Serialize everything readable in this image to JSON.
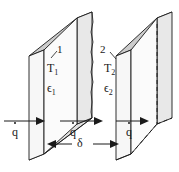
{
  "figure": {
    "background_color": "#ffffff",
    "line_color": "#1a1a1a",
    "face_front_color": "#f2f2f2",
    "face_edge_color": "#d9d9d9",
    "face_top_color": "#cccccc"
  },
  "plates": [
    {
      "id": "plate-1",
      "number_label": "1",
      "temperature_label": "T",
      "temperature_subscript": "1",
      "emissivity_label": "ϵ",
      "emissivity_subscript": "1",
      "hidden_edges": false
    },
    {
      "id": "plate-2",
      "number_label": "2",
      "temperature_label": "T",
      "temperature_subscript": "2",
      "emissivity_label": "ϵ",
      "emissivity_subscript": "2",
      "hidden_edges": true
    }
  ],
  "flux_arrows": [
    {
      "id": "flux-left",
      "label": "q",
      "has_dot": true
    },
    {
      "id": "flux-middle",
      "label": "q",
      "has_dot": true
    },
    {
      "id": "flux-right",
      "label": "q",
      "has_dot": true
    }
  ],
  "dimension": {
    "id": "gap-dimension",
    "label": "δ",
    "description": "gap between plate 1 and plate 2"
  }
}
